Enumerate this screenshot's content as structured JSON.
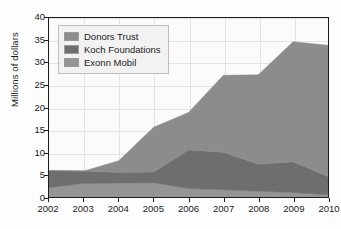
{
  "chart_data": {
    "type": "area",
    "stacked": true,
    "title": "",
    "subtitle": "",
    "xlabel": "",
    "ylabel": "Millions of dollars",
    "categories": [
      "2002",
      "2003",
      "2004",
      "2005",
      "2006",
      "2007",
      "2008",
      "2009",
      "2010"
    ],
    "x": [
      2002,
      2003,
      2004,
      2005,
      2006,
      2007,
      2008,
      2009,
      2010
    ],
    "xlim": [
      2002,
      2010
    ],
    "ylim": [
      0,
      40
    ],
    "yticks": [
      0,
      5,
      10,
      15,
      20,
      25,
      30,
      35,
      40
    ],
    "xticks": [
      "2002",
      "2003",
      "2004",
      "2005",
      "2006",
      "2007",
      "2008",
      "2009",
      "2010"
    ],
    "ytick_labels": [
      "0",
      "5",
      "10",
      "15",
      "20",
      "25",
      "30",
      "35",
      "40"
    ],
    "grid": true,
    "grid_axis": "both",
    "legend_position": "top-left",
    "series": [
      {
        "name": "Donors Trust",
        "color": "#8c8c8c",
        "values": [
          0.0,
          0.0,
          2.6,
          10.0,
          8.4,
          17.2,
          20.0,
          26.8,
          29.3
        ]
      },
      {
        "name": "Koch Foundations",
        "color": "#6e6e6e",
        "values": [
          3.8,
          2.8,
          2.4,
          2.4,
          8.6,
          8.4,
          6.0,
          6.9,
          4.1
        ]
      },
      {
        "name": "Exonn Mobil",
        "color": "#949494",
        "values": [
          2.1,
          3.0,
          3.1,
          3.2,
          1.9,
          1.6,
          1.3,
          1.0,
          0.5
        ]
      }
    ],
    "stack_order_bottom_to_top": [
      "Exonn Mobil",
      "Koch Foundations",
      "Donors Trust"
    ],
    "totals": [
      5.9,
      5.8,
      8.1,
      15.6,
      18.9,
      27.2,
      27.3,
      34.7,
      33.9
    ]
  },
  "legend": {
    "items": [
      {
        "label": "Donors Trust"
      },
      {
        "label": "Koch Foundations"
      },
      {
        "label": "Exonn Mobil"
      }
    ]
  }
}
